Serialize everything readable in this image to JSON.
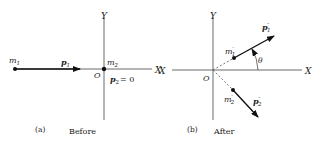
{
  "panels": [
    {
      "id": "a",
      "caption_letter": "(a)",
      "caption_text": "Before",
      "axes": {
        "x_label": "X",
        "y_label": "Y",
        "origin_label": "O"
      },
      "particles": [
        {
          "mass_label": "m",
          "mass_sub": "1",
          "momentum_label": "p",
          "momentum_sub": "1"
        },
        {
          "mass_label": "m",
          "mass_sub": "2",
          "momentum_label": "p",
          "momentum_sub": "2",
          "momentum_value": "= 0"
        }
      ]
    },
    {
      "id": "b",
      "caption_letter": "(b)",
      "caption_text": "After",
      "axes": {
        "x_label_left": "X",
        "x_label": "X",
        "y_label": "Y",
        "origin_label": "O"
      },
      "angle_label": "θ",
      "particles": [
        {
          "mass_label": "m",
          "mass_sub": "1",
          "prime": "′",
          "momentum_label": "p",
          "momentum_sub": "1"
        },
        {
          "mass_label": "m",
          "mass_sub": "2",
          "prime": "′",
          "momentum_label": "p",
          "momentum_sub": "2"
        }
      ]
    }
  ]
}
